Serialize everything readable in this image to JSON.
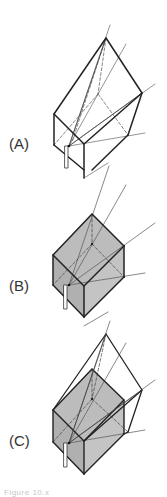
{
  "figure": {
    "panels": [
      {
        "id": "A",
        "label": "(A)",
        "description": "Wireframe truncated pyramid view volume with sightlines from eye point"
      },
      {
        "id": "B",
        "label": "(B)",
        "description": "Shaded cube with sightlines converging at eye point"
      },
      {
        "id": "C",
        "label": "(C)",
        "description": "Shaded cube inside wireframe view volume, combined"
      }
    ],
    "caption": "Figure 10.x"
  },
  "colors": {
    "stroke": "#222222",
    "thin": "#555555",
    "fill": "#b9b9b9",
    "fill_light": "#cfcfcf",
    "background": "#ffffff"
  }
}
